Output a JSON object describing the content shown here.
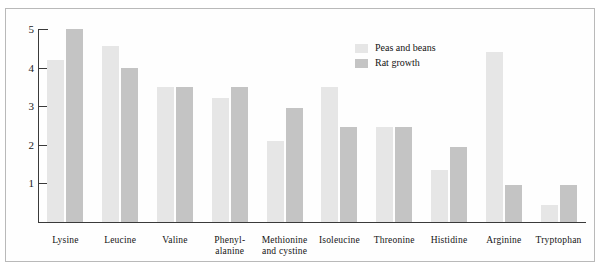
{
  "chart_data": {
    "type": "bar",
    "title": "",
    "subtitle": "",
    "xlabel": "",
    "ylabel": "",
    "ylim": [
      0,
      5.2
    ],
    "yticks": [
      1,
      2,
      3,
      4,
      5
    ],
    "ytick_labels": [
      "1",
      "2",
      "3",
      "4",
      "5"
    ],
    "grid": false,
    "legend_position": "inside-top-right",
    "categories": [
      "Lysine",
      "Leucine",
      "Valine",
      "Phenyl-\nalanine",
      "Methionine\nand cystine",
      "Isoleucine",
      "Threonine",
      "Histidine",
      "Arginine",
      "Tryptophan"
    ],
    "series": [
      {
        "name": "Peas and beans",
        "color": "#e6e6e6",
        "values": [
          4.2,
          4.55,
          3.5,
          3.2,
          2.1,
          3.5,
          2.45,
          1.35,
          4.4,
          0.45
        ]
      },
      {
        "name": "Rat growth",
        "color": "#c4c4c4",
        "values": [
          5.0,
          4.0,
          3.5,
          3.5,
          2.95,
          2.45,
          2.45,
          1.95,
          0.95,
          0.95
        ]
      }
    ]
  },
  "legend": {
    "items": [
      {
        "label": "Peas and beans",
        "color": "#e6e6e6"
      },
      {
        "label": "Rat growth",
        "color": "#c4c4c4"
      }
    ]
  },
  "axis": {
    "y_tick_labels": [
      "5",
      "4",
      "3",
      "2",
      "1"
    ]
  }
}
